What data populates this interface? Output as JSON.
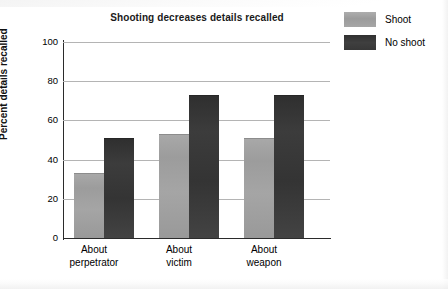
{
  "chart_data": {
    "type": "bar",
    "title": "Shooting decreases details recalled",
    "xlabel": "",
    "ylabel": "Percent details recalled",
    "categories": [
      "About perpetrator",
      "About victim",
      "About weapon"
    ],
    "category_lines": [
      [
        "About",
        "perpetrator"
      ],
      [
        "About",
        "victim"
      ],
      [
        "About",
        "weapon"
      ]
    ],
    "series": [
      {
        "name": "Shoot",
        "values": [
          33,
          53,
          51
        ],
        "color": "#a0a0a0"
      },
      {
        "name": "No shoot",
        "values": [
          51,
          73,
          73
        ],
        "color": "#373737"
      }
    ],
    "ylim": [
      0,
      100
    ],
    "yticks": [
      0,
      20,
      40,
      60,
      80,
      100
    ],
    "ytick_labels": [
      "0",
      "20",
      "40",
      "60",
      "80",
      "100"
    ],
    "grid": "horizontal",
    "legend_position": "top-right"
  },
  "legend": {
    "items": [
      {
        "label": "Shoot",
        "swatch": "shoot-swatch"
      },
      {
        "label": "No shoot",
        "swatch": "no-shoot-swatch"
      }
    ]
  }
}
